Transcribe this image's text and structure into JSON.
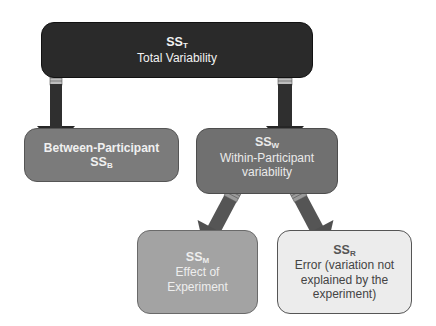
{
  "diagram": {
    "type": "hierarchy",
    "nodes": [
      {
        "id": "total",
        "ss_label": "SS",
        "ss_sub": "T",
        "description": "Total Variability",
        "fill": "#2a2a2a",
        "text_color": "#f2f2f2"
      },
      {
        "id": "between",
        "ss_label": "SS",
        "ss_sub": "B",
        "description": "Between-Participant",
        "fill": "#7b7b7b",
        "text_color": "#f0f0f0"
      },
      {
        "id": "within",
        "ss_label": "SS",
        "ss_sub": "W",
        "description": "Within-Participant variability",
        "fill": "#707070",
        "text_color": "#eaeaea"
      },
      {
        "id": "model",
        "ss_label": "SS",
        "ss_sub": "M",
        "description": "Effect of Experiment",
        "fill": "#a3a3a3",
        "text_color": "#eeeeee"
      },
      {
        "id": "residual",
        "ss_label": "SS",
        "ss_sub": "R",
        "description": "Error (variation not explained by the experiment)",
        "fill": "#ececec",
        "text_color": "#444444"
      }
    ],
    "edges": [
      {
        "from": "total",
        "to": "between"
      },
      {
        "from": "total",
        "to": "within"
      },
      {
        "from": "within",
        "to": "model"
      },
      {
        "from": "within",
        "to": "residual"
      }
    ],
    "arrow_color": "#333333"
  },
  "boxes": {
    "total": {
      "ss": "SS",
      "sub": "T",
      "desc": "Total Variability"
    },
    "between": {
      "desc": "Between-Participant",
      "ss": "SS",
      "sub": "B"
    },
    "within": {
      "ss": "SS",
      "sub": "W",
      "desc1": "Within-Participant",
      "desc2": "variability"
    },
    "model": {
      "ss": "SS",
      "sub": "M",
      "desc1": "Effect of",
      "desc2": "Experiment"
    },
    "residual": {
      "ss": "SS",
      "sub": "R",
      "desc1": "Error (variation not",
      "desc2": "explained by the",
      "desc3": "experiment)"
    }
  }
}
